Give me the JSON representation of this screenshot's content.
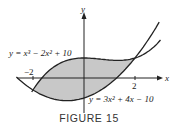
{
  "figure": {
    "caption": "FIGURE 15",
    "axes": {
      "x_label": "x",
      "y_label": "y"
    },
    "ticks": {
      "neg": "−2",
      "pos": "2"
    },
    "curves": {
      "upper_label": "y = x³ − 2x² + 10",
      "lower_label": "y = 3x² + 4x − 10"
    },
    "colors": {
      "shade": "#c8c8c8",
      "curve": "#222222",
      "axis": "#222222"
    }
  }
}
